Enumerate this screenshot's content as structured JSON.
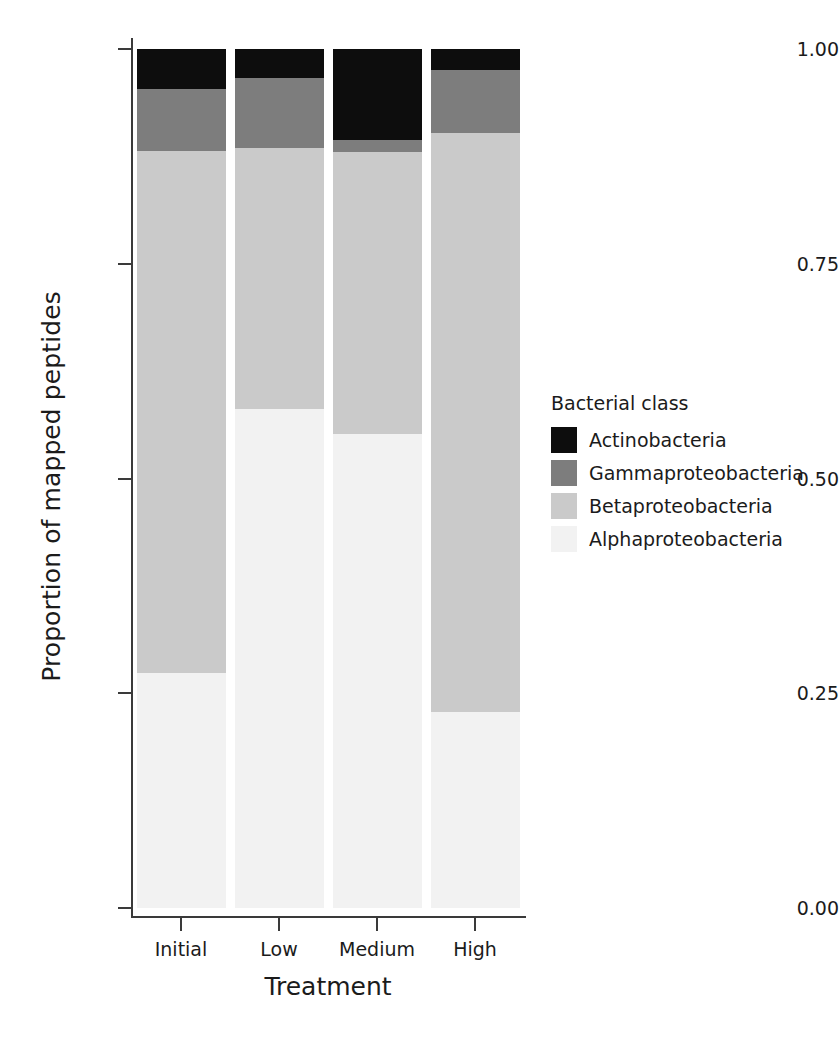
{
  "chart_data": {
    "type": "bar",
    "subtype": "stacked-proportional",
    "title": "",
    "xlabel": "Treatment",
    "ylabel": "Proportion of mapped peptides",
    "categories": [
      "Initial",
      "Low",
      "Medium",
      "High"
    ],
    "ylim": [
      0.0,
      1.0
    ],
    "yticks": [
      "0.00",
      "0.25",
      "0.50",
      "0.75",
      "1.00"
    ],
    "ytick_values": [
      0.0,
      0.25,
      0.5,
      0.75,
      1.0
    ],
    "grid": false,
    "legend_position": "right",
    "legend_title": "Bacterial class",
    "stack_order_bottom_to_top": [
      "Alphaproteobacteria",
      "Betaproteobacteria",
      "Gammaproteobacteria",
      "Actinobacteria"
    ],
    "series": [
      {
        "name": "Actinobacteria",
        "color": "#0d0d0d",
        "values": [
          0.046,
          0.034,
          0.106,
          0.024
        ]
      },
      {
        "name": "Gammaproteobacteria",
        "color": "#7d7d7d",
        "values": [
          0.073,
          0.081,
          0.014,
          0.074
        ]
      },
      {
        "name": "Betaproteobacteria",
        "color": "#cacaca",
        "values": [
          0.607,
          0.304,
          0.328,
          0.674
        ]
      },
      {
        "name": "Alphaproteobacteria",
        "color": "#f2f2f2",
        "values": [
          0.274,
          0.581,
          0.552,
          0.228
        ]
      }
    ]
  },
  "axes": {
    "x_label": "Treatment",
    "y_label": "Proportion of mapped peptides"
  },
  "legend": {
    "title": "Bacterial class",
    "entries": [
      {
        "label": "Actinobacteria",
        "color": "#0d0d0d"
      },
      {
        "label": "Gammaproteobacteria",
        "color": "#7d7d7d"
      },
      {
        "label": "Betaproteobacteria",
        "color": "#cacaca"
      },
      {
        "label": "Alphaproteobacteria",
        "color": "#f2f2f2"
      }
    ]
  },
  "colors": {
    "axis": "#3a3a3a",
    "text": "#1b1b1b",
    "background": "#ffffff"
  }
}
